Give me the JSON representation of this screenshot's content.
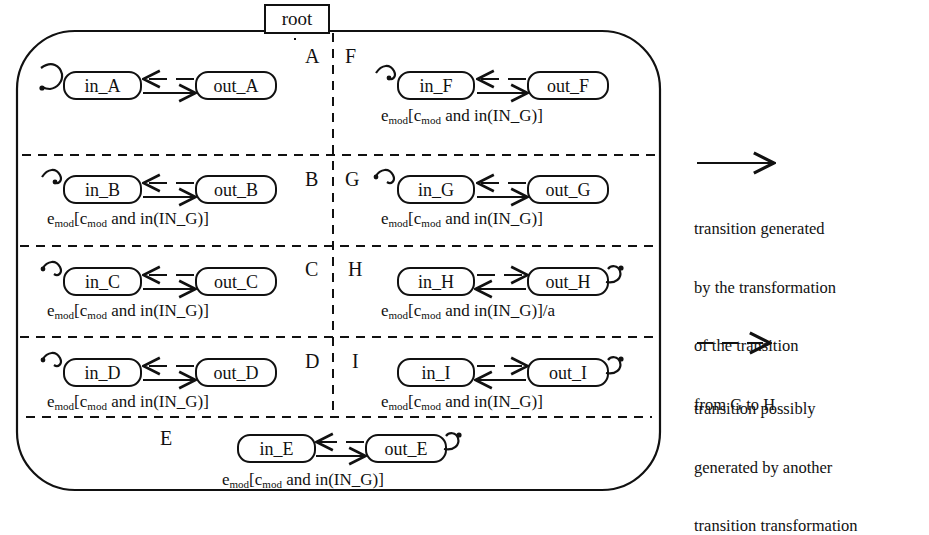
{
  "root": {
    "label": "root"
  },
  "transition_label": {
    "prefix_e": "e",
    "sub_mod": "mod",
    "open_bracket": "[",
    "c": "c",
    "mid": " and in(IN_G)]",
    "with_action_suffix": "/a"
  },
  "regions": [
    {
      "id": "A",
      "letter": "A",
      "in": "in_A",
      "out": "out_A",
      "label_text": "",
      "has_label": false,
      "loop_side": "left",
      "mirrored": false
    },
    {
      "id": "B",
      "letter": "B",
      "in": "in_B",
      "out": "out_B",
      "has_label": true,
      "loop_side": "left",
      "mirrored": false
    },
    {
      "id": "C",
      "letter": "C",
      "in": "in_C",
      "out": "out_C",
      "has_label": true,
      "loop_side": "left",
      "mirrored": false
    },
    {
      "id": "D",
      "letter": "D",
      "in": "in_D",
      "out": "out_D",
      "has_label": true,
      "loop_side": "left",
      "mirrored": false
    },
    {
      "id": "E",
      "letter": "E",
      "in": "in_E",
      "out": "out_E",
      "has_label": true,
      "loop_side": "right",
      "mirrored": false
    },
    {
      "id": "F",
      "letter": "F",
      "in": "in_F",
      "out": "out_F",
      "has_label": true,
      "loop_side": "left",
      "mirrored": false
    },
    {
      "id": "G",
      "letter": "G",
      "in": "in_G",
      "out": "out_G",
      "has_label": true,
      "loop_side": "left",
      "mirrored": false
    },
    {
      "id": "H",
      "letter": "H",
      "in": "in_H",
      "out": "out_H",
      "has_label": true,
      "loop_side": "right",
      "mirrored": true,
      "action": "/a"
    },
    {
      "id": "I",
      "letter": "I",
      "in": "in_I",
      "out": "out_I",
      "has_label": true,
      "loop_side": "right",
      "mirrored": true
    }
  ],
  "states": {
    "in_A": "in_A",
    "out_A": "out_A",
    "in_B": "in_B",
    "out_B": "out_B",
    "in_C": "in_C",
    "out_C": "out_C",
    "in_D": "in_D",
    "out_D": "out_D",
    "in_E": "in_E",
    "out_E": "out_E",
    "in_F": "in_F",
    "out_F": "out_F",
    "in_G": "in_G",
    "out_G": "out_G",
    "in_H": "in_H",
    "out_H": "out_H",
    "in_I": "in_I",
    "out_I": "out_I"
  },
  "legend": [
    {
      "arrow": "solid-arrow-icon",
      "lines": [
        "transition generated",
        "by the transformation",
        "of the transition",
        "from G to H"
      ]
    },
    {
      "arrow": "dashed-arrow-icon",
      "lines": [
        "transition possibly",
        "generated by another",
        "transition transformation"
      ]
    }
  ],
  "colors": {
    "stroke": "#111111",
    "background": "#ffffff"
  }
}
